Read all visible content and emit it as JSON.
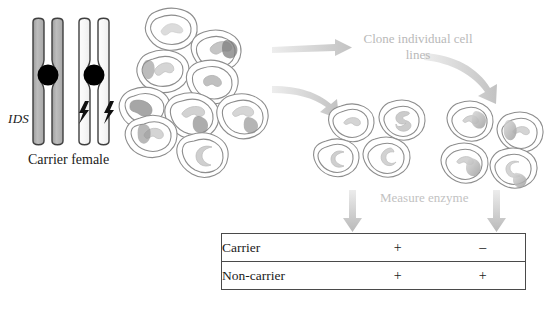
{
  "figure": {
    "gene_label": "IDS",
    "genotype_label": "Carrier female"
  },
  "annotations": {
    "clone_step": "Clone individual cell lines",
    "measure_step": "Measure enzyme"
  },
  "chromosomes": [
    {
      "name": "normal-x-chromosome",
      "fill": "#b3b3b3",
      "mutation": false
    },
    {
      "name": "mutant-x-chromosome",
      "fill": "#fbfbfb",
      "mutation": true
    }
  ],
  "icons": {
    "lightning": "lightning-bolt-icon",
    "arrow_right": "arrow-right-icon",
    "arrow_down": "arrow-down-icon",
    "arrow_curve": "curved-arrow-icon"
  },
  "colors": {
    "chromosome_gray": "#b3b3b3",
    "chromosome_white": "#fbfbfb",
    "centromere": "#000000",
    "cell_outline": "#8d8d8d",
    "nucleus_light": "#e3e3e3",
    "nucleus_dark": "#9a9a9a",
    "arrow_gray": "#c9c9c9",
    "table_border": "#4a4a4a",
    "text": "#1a1a1a",
    "faded_text": "#bcbcbc"
  },
  "cell_populations": {
    "mixed_population": {
      "name": "mixed-fibroblast-population",
      "count": 10,
      "description": "Mixed population of carrier female fibroblasts"
    },
    "clone_a": {
      "name": "clone-line-a",
      "count": 4,
      "enzyme": "positive",
      "description": "Cloned cell line expressing enzyme"
    },
    "clone_b": {
      "name": "clone-line-b",
      "count": 4,
      "enzyme": "negative",
      "description": "Cloned cell line lacking enzyme"
    }
  },
  "results": {
    "columns": [
      "",
      "Clone line A",
      "Clone line B"
    ],
    "rows": [
      {
        "label": "Carrier",
        "col1": "+",
        "col2": "–"
      },
      {
        "label": "Non-carrier",
        "col1": "+",
        "col2": "+"
      }
    ]
  }
}
